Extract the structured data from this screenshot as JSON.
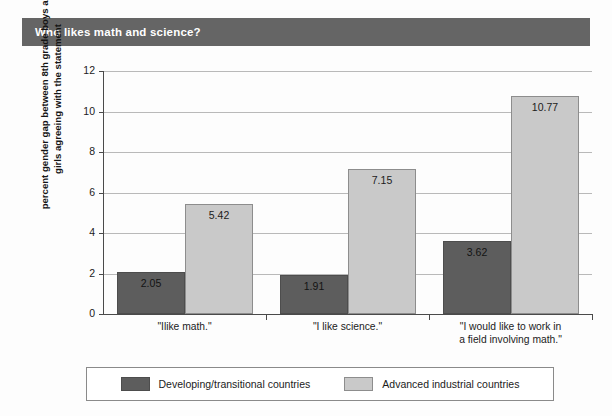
{
  "title": {
    "text": "Who likes math and science?"
  },
  "legend": {
    "entries": [
      {
        "label": "Developing/transitional countries",
        "color": "#5d5d5d",
        "swatch": "dark"
      },
      {
        "label": "Advanced industrial countries",
        "color": "#c9c9c9",
        "swatch": "light"
      }
    ]
  },
  "axis": {
    "y_label": "percent gender gap between 8th grade boys and\ngirls agreeing with the statement",
    "y_ticks": [
      "0",
      "2",
      "4",
      "6",
      "8",
      "10",
      "12"
    ]
  },
  "colors": {
    "title_band": "#656565",
    "dark_series": "#5d5d5d",
    "light_series": "#c9c9c9",
    "gridline": "#b9b9b9",
    "axis": "#4a4a4a"
  },
  "chart_data": {
    "type": "bar",
    "title": "Who likes math and science?",
    "xlabel": "",
    "ylabel": "percent gender gap between 8th grade boys and girls agreeing with the statement",
    "ylim": [
      0,
      12
    ],
    "yticks": [
      0,
      2,
      4,
      6,
      8,
      10,
      12
    ],
    "grid": true,
    "legend_position": "bottom",
    "categories": [
      "\"Ilike math.\"",
      "\"I like science.\"",
      "\"I would like to work in\na field involving math.\""
    ],
    "series": [
      {
        "name": "Developing/transitional countries",
        "color": "#5d5d5d",
        "values": [
          2.05,
          1.91,
          3.62
        ],
        "labels": [
          "2.05",
          "1.91",
          "3.62"
        ]
      },
      {
        "name": "Advanced industrial countries",
        "color": "#c9c9c9",
        "values": [
          5.42,
          7.15,
          10.77
        ],
        "labels": [
          "5.42",
          "7.15",
          "10.77"
        ]
      }
    ]
  }
}
